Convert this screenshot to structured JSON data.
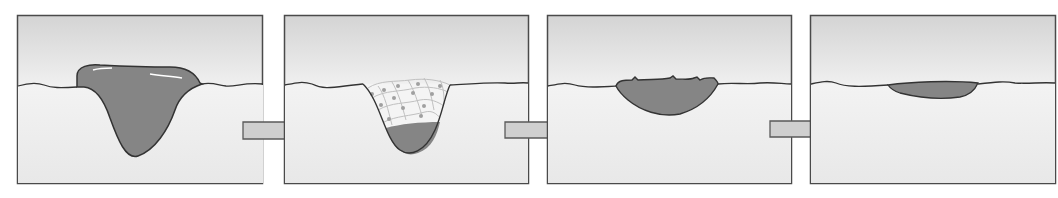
{
  "diagram": {
    "type": "process-sequence",
    "colors": {
      "background": "#ffffff",
      "panel_top": "#d6d6d6",
      "panel_bottom": "#f4f4f4",
      "outline": "#4a4a4a",
      "fill_dark": "#858585",
      "cells": "#c4c4c4",
      "cell_nucleus": "#9a9a9a",
      "arrow_fill": "#cfcfcf",
      "arrow_stroke": "#5a5a5a"
    },
    "panels": [
      {
        "id": 1,
        "label": "",
        "stage": "wound filled with clot / scab"
      },
      {
        "id": 2,
        "label": "",
        "stage": "new cells grow into wound"
      },
      {
        "id": 3,
        "label": "",
        "stage": "wound shrinks, scab on surface"
      },
      {
        "id": 4,
        "label": "",
        "stage": "nearly healed, thin remnant"
      }
    ],
    "arrows": [
      {
        "from": 1,
        "to": 2
      },
      {
        "from": 2,
        "to": 3
      },
      {
        "from": 3,
        "to": 4
      }
    ]
  }
}
